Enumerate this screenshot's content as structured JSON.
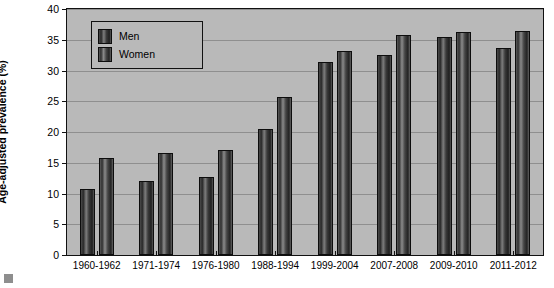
{
  "chart_data": {
    "type": "bar",
    "title": "",
    "xlabel": "",
    "ylabel": "Age-adjusted prevalence (%)",
    "ylim": [
      0,
      40
    ],
    "ytick_step": 5,
    "yticks": [
      "0",
      "5",
      "10",
      "15",
      "20",
      "25",
      "30",
      "35",
      "40"
    ],
    "grid": true,
    "legend_position": "top-left",
    "categories": [
      "1960-1962",
      "1971-1974",
      "1976-1980",
      "1988-1994",
      "1999-2004",
      "2007-2008",
      "2009-2010",
      "2011-2012"
    ],
    "series": [
      {
        "name": "Men",
        "color": "#333333",
        "values": [
          10.7,
          12.1,
          12.7,
          20.5,
          31.4,
          32.5,
          35.4,
          33.6
        ]
      },
      {
        "name": "Women",
        "color": "#333333",
        "values": [
          15.7,
          16.6,
          17.0,
          25.7,
          33.2,
          35.8,
          36.2,
          36.4
        ]
      }
    ]
  },
  "legend": {
    "items": [
      {
        "label": "Men"
      },
      {
        "label": "Women"
      }
    ]
  }
}
